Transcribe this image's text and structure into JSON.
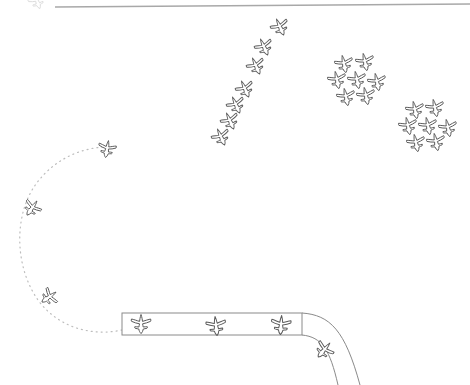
{
  "canvas": {
    "width": 470,
    "height": 385,
    "background": "#ffffff",
    "title": "Airport traffic sketch"
  },
  "style": {
    "ink": "#555555",
    "ink_light": "#8f8f8f",
    "ink_faint": "#cfcfcf",
    "runway_fill": "#ffffff",
    "runway_stroke": "#8a8a8a",
    "stroke_width": 1
  },
  "labels": {
    "scene_title": "Airport traffic sketch",
    "runway_name": "runway",
    "taxiway_name": "taxiway",
    "approach_path_name": "dotted approach path",
    "top_border_name": "top border line",
    "queue_name": "approach queue",
    "cluster_a_name": "holding cluster A",
    "cluster_b_name": "holding cluster B"
  },
  "top_border": {
    "x1": 55,
    "y1": 7,
    "x2": 470,
    "y2": 4,
    "color": "#a8a8a8",
    "width": 1.6
  },
  "runway": {
    "x": 122,
    "y": 313,
    "width": 180,
    "height": 22,
    "stroke": "#8a8a8a",
    "fill": "#ffffff"
  },
  "taxiway": {
    "outer": "M302,313 C330,315 345,330 360,385",
    "inner": "M302,335 C322,337 330,350 338,385",
    "stroke": "#8a8a8a"
  },
  "approach_path": {
    "d": "M122,330 C95,336 60,330 38,300 C14,266 14,214 36,184 C58,154 90,146 112,147",
    "stroke": "#bdbdbd",
    "dash": "1,4"
  },
  "sprites": {
    "icon_name": "aircraft-icon",
    "groups": [
      {
        "id": "runway-aircraft",
        "name": "runway-aircraft-group",
        "count": 3,
        "items": [
          {
            "x": 141,
            "y": 324,
            "r": 0,
            "s": 1.0
          },
          {
            "x": 216,
            "y": 326,
            "r": -6,
            "s": 1.0
          },
          {
            "x": 281,
            "y": 325,
            "r": 4,
            "s": 1.0
          }
        ]
      },
      {
        "id": "taxiway-aircraft",
        "name": "taxiway-aircraft-group",
        "count": 1,
        "items": [
          {
            "x": 324,
            "y": 350,
            "r": 40,
            "s": 0.95
          }
        ]
      },
      {
        "id": "approach-queue",
        "name": "approach-queue-group",
        "count": 3,
        "items": [
          {
            "x": 107,
            "y": 149,
            "r": 10,
            "s": 0.9
          },
          {
            "x": 32,
            "y": 208,
            "r": 35,
            "s": 0.9
          },
          {
            "x": 49,
            "y": 297,
            "r": 55,
            "s": 0.9
          }
        ]
      },
      {
        "id": "diagonal-stream",
        "name": "diagonal-stream-group",
        "count": 7,
        "items": [
          {
            "x": 280,
            "y": 27,
            "r": -24,
            "s": 0.92
          },
          {
            "x": 264,
            "y": 47,
            "r": -24,
            "s": 0.92
          },
          {
            "x": 256,
            "y": 66,
            "r": -24,
            "s": 0.92
          },
          {
            "x": 245,
            "y": 89,
            "r": -24,
            "s": 0.92
          },
          {
            "x": 236,
            "y": 105,
            "r": -24,
            "s": 0.92
          },
          {
            "x": 230,
            "y": 121,
            "r": -24,
            "s": 0.92
          },
          {
            "x": 221,
            "y": 137,
            "r": -24,
            "s": 0.92
          }
        ]
      },
      {
        "id": "cluster-a",
        "name": "cluster-a-group",
        "count": 7,
        "items": [
          {
            "x": 344,
            "y": 64,
            "r": -12,
            "s": 0.92
          },
          {
            "x": 365,
            "y": 62,
            "r": -12,
            "s": 0.92
          },
          {
            "x": 337,
            "y": 80,
            "r": -12,
            "s": 0.92
          },
          {
            "x": 357,
            "y": 80,
            "r": -12,
            "s": 0.92
          },
          {
            "x": 377,
            "y": 82,
            "r": -12,
            "s": 0.92
          },
          {
            "x": 346,
            "y": 97,
            "r": -12,
            "s": 0.92
          },
          {
            "x": 366,
            "y": 96,
            "r": -12,
            "s": 0.92
          }
        ]
      },
      {
        "id": "cluster-b",
        "name": "cluster-b-group",
        "count": 7,
        "items": [
          {
            "x": 415,
            "y": 110,
            "r": -12,
            "s": 0.92
          },
          {
            "x": 435,
            "y": 108,
            "r": -12,
            "s": 0.92
          },
          {
            "x": 408,
            "y": 126,
            "r": -12,
            "s": 0.92
          },
          {
            "x": 428,
            "y": 126,
            "r": -12,
            "s": 0.92
          },
          {
            "x": 448,
            "y": 128,
            "r": -12,
            "s": 0.92
          },
          {
            "x": 416,
            "y": 143,
            "r": -12,
            "s": 0.92
          },
          {
            "x": 436,
            "y": 142,
            "r": -12,
            "s": 0.92
          }
        ]
      },
      {
        "id": "top-edge-partial",
        "name": "top-edge-partial-group",
        "count": 1,
        "items": [
          {
            "x": 37,
            "y": 1,
            "r": -20,
            "s": 0.85,
            "opacity": 0.22
          }
        ]
      }
    ]
  }
}
